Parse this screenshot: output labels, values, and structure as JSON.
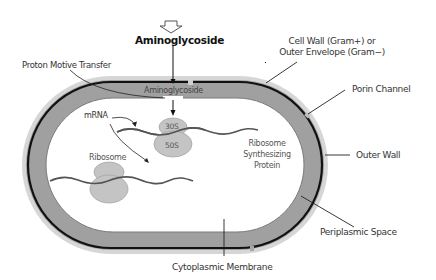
{
  "diagram": {
    "title_arrow_label": "Aminoglycoside",
    "labels": {
      "cell_wall_line1": "Cell Wall (Gram+) or",
      "cell_wall_line2": "Outer Envelope (Gram−)",
      "proton_motive": "Proton Motive Transfer",
      "aminoglycoside_inner": "Aminoglycoside",
      "porin_channel": "Porin Channel",
      "mrna": "mRNA",
      "subunit_30s": "30S",
      "subunit_50s": "50S",
      "ribosome_synth_line1": "Ribosome",
      "ribosome_synth_line2": "Synthesizing",
      "ribosome_synth_line3": "Protein",
      "ribosome": "Ribosome",
      "outer_wall": "Outer Wall",
      "periplasmic_space": "Periplasmic Space",
      "cytoplasmic_membrane": "Cytoplasmic Membrane"
    },
    "colors": {
      "periplasm_fill": "#9e9e9e",
      "halo": "#d4d4d4",
      "membrane_line": "#111111",
      "ribosome_fill": "#c2c2c2",
      "ribosome_stroke": "#a0a0a0",
      "mrna_stroke": "#555555",
      "leader_line": "#222222"
    }
  }
}
